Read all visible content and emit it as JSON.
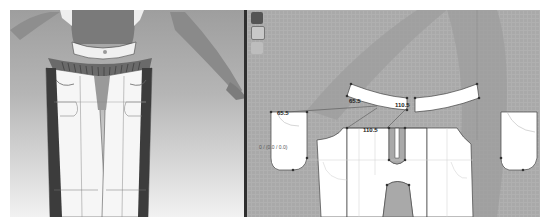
{
  "viewports": {
    "avatar_3d": {
      "label": "3D Avatar View",
      "garment": "pants with waistband and pleated hip band"
    },
    "pattern_2d": {
      "label": "2D Pattern View",
      "toolbar": [
        {
          "name": "select-tool",
          "glyph": "✎"
        },
        {
          "name": "transform-tool",
          "glyph": "⬚"
        },
        {
          "name": "edit-point-tool",
          "glyph": "↖"
        }
      ],
      "measurements": [
        {
          "id": "m1",
          "value": "65.5"
        },
        {
          "id": "m2",
          "value": "65.5"
        },
        {
          "id": "m3",
          "value": "110.5"
        },
        {
          "id": "m4",
          "value": "110.5"
        }
      ],
      "coordinate_readout": "0 / (0.0 / 0.0)"
    }
  },
  "colors": {
    "pattern_bg": "#a9a9a9",
    "pattern_piece": "#ffffff",
    "seam_line": "#555555",
    "divider": "#2e2e2e"
  }
}
